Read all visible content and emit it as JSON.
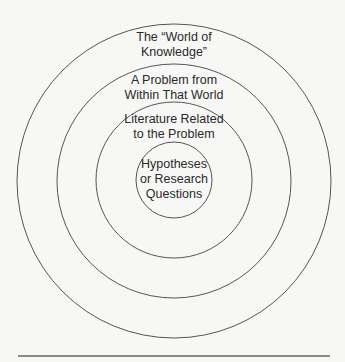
{
  "diagram": {
    "type": "concentric-circles",
    "rings": [
      {
        "id": "world",
        "label": "The “World of\nKnowledge”",
        "r": 157
      },
      {
        "id": "problem",
        "label": "A Problem from\nWithin That World",
        "r": 117
      },
      {
        "id": "literature",
        "label": "Literature Related\nto the Problem",
        "r": 78
      },
      {
        "id": "hypotheses",
        "label": "Hypotheses\nor Research\nQuestions",
        "r": 38
      }
    ],
    "center": {
      "x": 174,
      "y": 181
    },
    "stroke_color": "#555555",
    "rule_color": "#8a8a8a"
  }
}
